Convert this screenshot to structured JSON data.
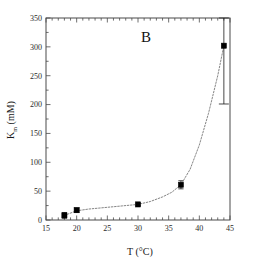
{
  "figure": {
    "panel_label": "B",
    "background_color": "#ffffff",
    "frame_color": "#4a4a4a"
  },
  "chart_data": {
    "type": "scatter",
    "title": "B",
    "xlabel": "T (°C)",
    "ylabel": "K",
    "ylabel_sub": "m",
    "ylabel_unit": " (mM)",
    "xlim": [
      15,
      45
    ],
    "ylim": [
      0,
      350
    ],
    "xticks": [
      15,
      20,
      25,
      30,
      35,
      40,
      45
    ],
    "xtick_labels": [
      "15",
      "20",
      "25",
      "30",
      "35",
      "40",
      "45"
    ],
    "yticks": [
      0,
      50,
      100,
      150,
      200,
      250,
      300,
      350
    ],
    "ytick_labels": [
      "0",
      "50",
      "100",
      "150",
      "200",
      "250",
      "300",
      "350"
    ],
    "x_minor_per_major": 5,
    "y_minor_per_major": 2,
    "grid": false,
    "legend": null,
    "marker": "filled-square",
    "marker_color": "#000000",
    "line_style": "dashed-fit",
    "line_color": "#777777",
    "x": [
      18,
      20,
      30,
      37,
      44
    ],
    "y": [
      8,
      17,
      27,
      61,
      302
    ],
    "yerr": [
      5,
      4,
      2,
      7,
      101
    ],
    "points": [
      {
        "x": 18,
        "y": 8,
        "yerr": 5
      },
      {
        "x": 20,
        "y": 17,
        "yerr": 4
      },
      {
        "x": 30,
        "y": 27,
        "yerr": 2
      },
      {
        "x": 37,
        "y": 61,
        "yerr": 7
      },
      {
        "x": 44,
        "y": 302,
        "yerr": 101
      }
    ],
    "fit_curve": [
      {
        "x": 18,
        "y": 8
      },
      {
        "x": 20,
        "y": 16
      },
      {
        "x": 22,
        "y": 19
      },
      {
        "x": 24,
        "y": 21
      },
      {
        "x": 26,
        "y": 23
      },
      {
        "x": 28,
        "y": 25
      },
      {
        "x": 30,
        "y": 27
      },
      {
        "x": 32,
        "y": 32
      },
      {
        "x": 34,
        "y": 40
      },
      {
        "x": 35.5,
        "y": 48
      },
      {
        "x": 37,
        "y": 61
      },
      {
        "x": 38.5,
        "y": 88
      },
      {
        "x": 40,
        "y": 130
      },
      {
        "x": 41.5,
        "y": 185
      },
      {
        "x": 43,
        "y": 250
      },
      {
        "x": 44,
        "y": 302
      }
    ]
  }
}
